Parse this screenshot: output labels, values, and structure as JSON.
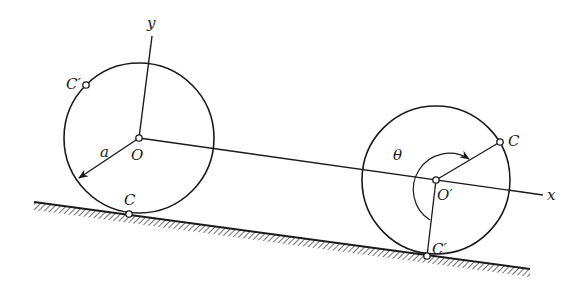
{
  "diagram": {
    "colors": {
      "ink": "#1a1a1a",
      "background": "#ffffff",
      "hatch": "#333333"
    },
    "labels": {
      "y_axis": "y",
      "x_axis": "x",
      "origin": "O",
      "origin_moved": "O′",
      "radius": "a",
      "angle": "θ",
      "contact_initial_left": "C",
      "point_prime_left": "C′",
      "point_c_right": "C",
      "point_prime_right": "C′"
    },
    "left_disk": {
      "center": [
        139,
        138
      ],
      "radius": 75
    },
    "right_disk": {
      "center": [
        436,
        180
      ],
      "radius": 74
    },
    "incline": {
      "start": [
        34,
        202
      ],
      "end": [
        530,
        269
      ]
    }
  }
}
